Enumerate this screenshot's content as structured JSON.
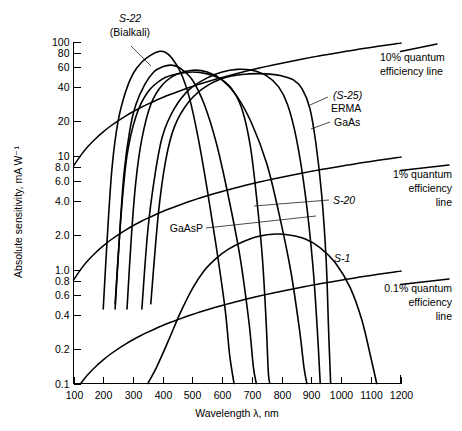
{
  "chart_data": {
    "type": "line",
    "title": "",
    "xlabel": "Wavelength λ, nm",
    "ylabel": "Absolute sensitivity, mA W⁻¹",
    "xlim": [
      100,
      1200
    ],
    "ylim": [
      0.1,
      100
    ],
    "yscale": "log",
    "xscale": "linear",
    "grid": false,
    "legend_position": "inline-annotations",
    "xticks": [
      100,
      200,
      300,
      400,
      500,
      600,
      700,
      800,
      900,
      1000,
      1100,
      1200
    ],
    "xtick_labels": [
      "100",
      "200",
      "300",
      "400",
      "500",
      "600",
      "700",
      "800",
      "900",
      "1000",
      "1100",
      "1200"
    ],
    "yticks": [
      0.1,
      0.2,
      0.4,
      0.6,
      0.8,
      1.0,
      2.0,
      4.0,
      6.0,
      8.0,
      10,
      20,
      40,
      60,
      80,
      100
    ],
    "ytick_labels": [
      "0.1",
      "0.2",
      "0.4",
      "0.6",
      "0.8",
      "1.0",
      "2.0",
      "4.0",
      "6.0",
      "8.0",
      "10",
      "20",
      "40",
      "60",
      "80",
      "100"
    ],
    "series": [
      {
        "name": "S-22 (Bialkali)",
        "label": "S-22",
        "sublabel": "(Bialkali)",
        "points": [
          [
            200,
            0.45
          ],
          [
            215,
            2.2
          ],
          [
            230,
            8
          ],
          [
            250,
            20
          ],
          [
            275,
            36
          ],
          [
            300,
            52
          ],
          [
            330,
            66
          ],
          [
            360,
            76
          ],
          [
            390,
            82
          ],
          [
            410,
            80
          ],
          [
            430,
            72
          ],
          [
            460,
            54
          ],
          [
            490,
            32
          ],
          [
            520,
            14
          ],
          [
            550,
            5
          ],
          [
            580,
            1.6
          ],
          [
            610,
            0.45
          ],
          [
            625,
            0.18
          ],
          [
            640,
            0.1
          ]
        ]
      },
      {
        "name": "S-11",
        "label": "",
        "points": [
          [
            240,
            0.45
          ],
          [
            255,
            2.0
          ],
          [
            270,
            7
          ],
          [
            290,
            17
          ],
          [
            310,
            28
          ],
          [
            340,
            42
          ],
          [
            370,
            54
          ],
          [
            400,
            60
          ],
          [
            430,
            62
          ],
          [
            460,
            58
          ],
          [
            500,
            46
          ],
          [
            540,
            28
          ],
          [
            580,
            13
          ],
          [
            620,
            4.5
          ],
          [
            660,
            1.3
          ],
          [
            690,
            0.35
          ],
          [
            705,
            0.14
          ],
          [
            715,
            0.1
          ]
        ]
      },
      {
        "name": "S-20",
        "label": "S-20",
        "points": [
          [
            280,
            0.45
          ],
          [
            295,
            2.0
          ],
          [
            310,
            6
          ],
          [
            330,
            14
          ],
          [
            360,
            28
          ],
          [
            400,
            42
          ],
          [
            450,
            52
          ],
          [
            500,
            56
          ],
          [
            550,
            54
          ],
          [
            600,
            46
          ],
          [
            650,
            33
          ],
          [
            700,
            19
          ],
          [
            750,
            8.5
          ],
          [
            790,
            3.2
          ],
          [
            830,
            1.0
          ],
          [
            860,
            0.3
          ],
          [
            875,
            0.14
          ],
          [
            885,
            0.1
          ]
        ]
      },
      {
        "name": "(S-25) ERMA",
        "label": "(S-25)",
        "sublabel": "ERMA",
        "points": [
          [
            330,
            0.45
          ],
          [
            350,
            2.2
          ],
          [
            375,
            7
          ],
          [
            400,
            15
          ],
          [
            440,
            26
          ],
          [
            490,
            38
          ],
          [
            550,
            48
          ],
          [
            600,
            54
          ],
          [
            650,
            57
          ],
          [
            700,
            56
          ],
          [
            750,
            50
          ],
          [
            790,
            40
          ],
          [
            820,
            28
          ],
          [
            850,
            14
          ],
          [
            880,
            4.5
          ],
          [
            905,
            1.1
          ],
          [
            920,
            0.3
          ],
          [
            930,
            0.1
          ]
        ]
      },
      {
        "name": "GaAsP",
        "label": "GaAsP",
        "points": [
          [
            240,
            0.5
          ],
          [
            260,
            3
          ],
          [
            280,
            10
          ],
          [
            310,
            22
          ],
          [
            350,
            36
          ],
          [
            400,
            47
          ],
          [
            450,
            52
          ],
          [
            500,
            54
          ],
          [
            550,
            52
          ],
          [
            600,
            46
          ],
          [
            640,
            36
          ],
          [
            670,
            24
          ],
          [
            695,
            12
          ],
          [
            715,
            4.5
          ],
          [
            735,
            1.3
          ],
          [
            748,
            0.35
          ],
          [
            755,
            0.13
          ],
          [
            760,
            0.1
          ]
        ]
      },
      {
        "name": "GaAs",
        "label": "GaAs",
        "points": [
          [
            360,
            0.5
          ],
          [
            385,
            3
          ],
          [
            410,
            9
          ],
          [
            440,
            18
          ],
          [
            490,
            30
          ],
          [
            550,
            41
          ],
          [
            620,
            49
          ],
          [
            690,
            52
          ],
          [
            750,
            52
          ],
          [
            800,
            50
          ],
          [
            840,
            46
          ],
          [
            870,
            38
          ],
          [
            895,
            26
          ],
          [
            915,
            13
          ],
          [
            935,
            4.5
          ],
          [
            950,
            1.2
          ],
          [
            958,
            0.3
          ],
          [
            965,
            0.1
          ]
        ]
      },
      {
        "name": "S-1",
        "label": "S-1",
        "points": [
          [
            350,
            0.1
          ],
          [
            380,
            0.14
          ],
          [
            420,
            0.24
          ],
          [
            460,
            0.42
          ],
          [
            500,
            0.68
          ],
          [
            540,
            0.98
          ],
          [
            580,
            1.25
          ],
          [
            620,
            1.5
          ],
          [
            670,
            1.75
          ],
          [
            720,
            1.95
          ],
          [
            780,
            2.05
          ],
          [
            830,
            2.0
          ],
          [
            880,
            1.85
          ],
          [
            930,
            1.55
          ],
          [
            980,
            1.15
          ],
          [
            1030,
            0.7
          ],
          [
            1070,
            0.36
          ],
          [
            1100,
            0.17
          ],
          [
            1120,
            0.1
          ]
        ]
      }
    ],
    "reference_lines": [
      {
        "name": "10% quantum efficiency line",
        "label_line1": "10% quantum",
        "label_line2": "efficiency line",
        "quantum_efficiency": 0.1,
        "formula": "S = QE * lambda / 1239.8 (A/W) -> mA/W",
        "endpoints_nm": [
          100,
          1200
        ],
        "endpoints_mA_per_W": [
          8.1,
          96.8
        ]
      },
      {
        "name": "1% quantum efficiency line",
        "label_line1": "1% quantum",
        "label_line2": "efficiency",
        "label_line3": "line",
        "quantum_efficiency": 0.01,
        "endpoints_nm": [
          100,
          1200
        ],
        "endpoints_mA_per_W": [
          0.81,
          9.68
        ]
      },
      {
        "name": "0.1% quantum efficiency line",
        "label_line1": "0.1% quantum",
        "label_line2": "efficiency",
        "label_line3": "line",
        "quantum_efficiency": 0.001,
        "endpoints_nm": [
          100,
          1200
        ],
        "endpoints_mA_per_W": [
          0.081,
          0.968
        ]
      }
    ],
    "annotations": [
      {
        "text": "S-22",
        "sub": "(Bialkali)",
        "x_nm": 330,
        "y_mA": 95
      },
      {
        "text": "(S-25)",
        "sub": "ERMA",
        "x_nm": 880,
        "y_mA": 33
      },
      {
        "text": "GaAs",
        "x_nm": 940,
        "y_mA": 17
      },
      {
        "text": "S-20",
        "x_nm": 930,
        "y_mA": 3.4
      },
      {
        "text": "GaAsP",
        "x_nm": 490,
        "y_mA": 2.6
      },
      {
        "text": "S-1",
        "x_nm": 960,
        "y_mA": 1.15
      }
    ]
  },
  "axes": {
    "x_title": "Wavelength λ, nm",
    "y_title": "Absolute sensitivity, mA W⁻¹",
    "x_tick_labels": [
      "100",
      "200",
      "300",
      "400",
      "500",
      "600",
      "700",
      "800",
      "900",
      "1000",
      "1100",
      "1200"
    ],
    "y_tick_labels": [
      "100",
      "80",
      "60",
      "40",
      "20",
      "10",
      "8.0",
      "6.0",
      "4.0",
      "2.0",
      "1.0",
      "0.8",
      "0.6",
      "0.4",
      "0.2",
      "0.1"
    ]
  },
  "labels": {
    "s22": "S-22",
    "s22_sub": "(Bialkali)",
    "s25": "(S-25)",
    "erma": "ERMA",
    "gaas": "GaAs",
    "s20": "S-20",
    "gaasp": "GaAsP",
    "s1": "S-1",
    "qe10_l1": "10% quantum",
    "qe10_l2": "efficiency line",
    "qe1_l1": "1% quantum",
    "qe1_l2": "efficiency",
    "qe1_l3": "line",
    "qe01_l1": "0.1% quantum",
    "qe01_l2": "efficiency",
    "qe01_l3": "line"
  },
  "colors": {
    "background": "#ffffff",
    "ink": "#000000"
  }
}
